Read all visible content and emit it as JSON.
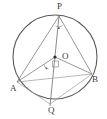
{
  "figure": {
    "kind": "circle-geometry-diagram",
    "background_color": "#ffffff",
    "stroke_color": "#5a5a5a",
    "chord_color": "#7d7d7d",
    "label_color": "#3b3b3b",
    "circle": {
      "center_label": "O",
      "center_x": 55,
      "center_y": 57,
      "radius": 42
    },
    "points": [
      {
        "name": "P",
        "label": "P",
        "x": 59,
        "y": 16,
        "on_circle": true
      },
      {
        "name": "O",
        "label": "O",
        "x": 55,
        "y": 57,
        "on_circle": false
      },
      {
        "name": "A",
        "label": "A",
        "x": 17,
        "y": 82,
        "on_circle": true
      },
      {
        "name": "B",
        "label": "B",
        "x": 92,
        "y": 74,
        "on_circle": true
      },
      {
        "name": "Q",
        "label": "Q",
        "x": 50,
        "y": 104,
        "on_circle": true
      }
    ],
    "segments": [
      {
        "name": "PA",
        "from": "P",
        "to": "A"
      },
      {
        "name": "PB",
        "from": "P",
        "to": "B"
      },
      {
        "name": "PQ",
        "from": "P",
        "to": "Q"
      },
      {
        "name": "OA",
        "from": "O",
        "to": "A"
      },
      {
        "name": "OB",
        "from": "O",
        "to": "B"
      },
      {
        "name": "AB",
        "from": "A",
        "to": "B"
      },
      {
        "name": "AQ",
        "from": "A",
        "to": "Q"
      },
      {
        "name": "QB",
        "from": "Q",
        "to": "B"
      }
    ],
    "angle_marks": [
      {
        "name": "angle-at-P",
        "at": "P",
        "style": "arc-with-dot"
      },
      {
        "name": "right-angle-at-O",
        "at": "O",
        "style": "square"
      },
      {
        "name": "angle-left-of-O",
        "at": "O",
        "style": "arc-with-dot"
      }
    ]
  },
  "labels": {
    "P": "P",
    "O": "O",
    "A": "A",
    "B": "B",
    "Q": "Q"
  }
}
